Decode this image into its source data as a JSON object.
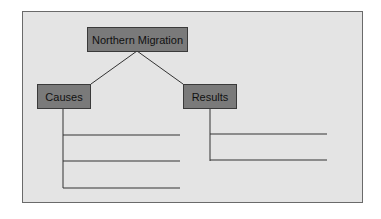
{
  "diagram": {
    "title": "Northern Migration",
    "branches": [
      {
        "label": "Causes",
        "blank_lines": 3
      },
      {
        "label": "Results",
        "blank_lines": 2
      }
    ],
    "colors": {
      "background": "#e4e4e4",
      "node_fill": "#7a7a7a",
      "line": "#333333"
    }
  }
}
